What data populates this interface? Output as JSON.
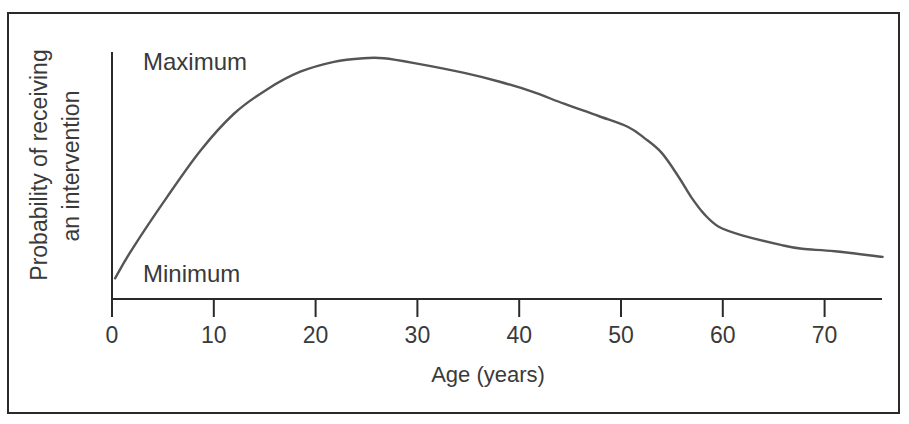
{
  "chart_data": {
    "type": "line",
    "title": "",
    "xlabel": "Age (years)",
    "ylabel": "Probability of receiving an intervention",
    "ylabel_lines": [
      "Probability of receiving",
      "an intervention"
    ],
    "y_level_labels": {
      "max": "Maximum",
      "min": "Minimum"
    },
    "x_ticks": [
      0,
      10,
      20,
      30,
      40,
      50,
      60,
      70
    ],
    "x_tick_labels": [
      "0",
      "10",
      "20",
      "30",
      "40",
      "50",
      "60",
      "70"
    ],
    "xlim": [
      0,
      75.5
    ],
    "ylim": [
      0,
      1
    ],
    "grid": false,
    "legend": null,
    "series": [
      {
        "name": "Probability of receiving an intervention",
        "x": [
          0.3,
          2,
          5.4,
          8.7,
          12,
          15.3,
          18.5,
          21.8,
          24.7,
          26.7,
          29.7,
          34.6,
          38,
          41.2,
          44.4,
          47.8,
          50.7,
          52.3,
          54,
          55.7,
          56.9,
          58.2,
          59.6,
          61.9,
          65.8,
          67.8,
          71,
          75.7
        ],
        "y": [
          0.08,
          0.2,
          0.41,
          0.6,
          0.75,
          0.85,
          0.92,
          0.96,
          0.975,
          0.975,
          0.955,
          0.915,
          0.88,
          0.84,
          0.79,
          0.74,
          0.695,
          0.65,
          0.59,
          0.49,
          0.41,
          0.34,
          0.29,
          0.255,
          0.215,
          0.2,
          0.19,
          0.167
        ]
      }
    ],
    "colors": {
      "line": "#555555",
      "axis": "#2a2a2a",
      "text": "#3a3a3a"
    }
  }
}
